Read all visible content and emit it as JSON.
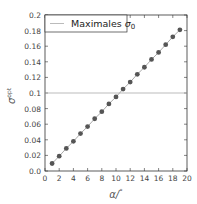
{
  "chart_data": {
    "type": "line",
    "title": "",
    "xlabel": "α/ °",
    "ylabel": "σ0^opt",
    "xlim": [
      0,
      20
    ],
    "ylim": [
      0,
      0.2
    ],
    "xticks": [
      "0",
      "2",
      "4",
      "6",
      "8",
      "10",
      "12",
      "14",
      "16",
      "18",
      "20"
    ],
    "yticks": [
      "0.0",
      "0.02",
      "0.04",
      "0.06",
      "0.08",
      "0.1",
      "0.12",
      "0.14",
      "0.16",
      "0.18",
      "0.2"
    ],
    "grid": false,
    "legend_position": "upper left",
    "series": [
      {
        "name": "σ0 opt",
        "style": "line+markers",
        "x": [
          1,
          2,
          3,
          4,
          5,
          6,
          7,
          8,
          9,
          10,
          11,
          12,
          13,
          14,
          15,
          16,
          17,
          18,
          19
        ],
        "values": [
          0.0096,
          0.019,
          0.029,
          0.038,
          0.048,
          0.057,
          0.067,
          0.076,
          0.086,
          0.095,
          0.105,
          0.114,
          0.124,
          0.133,
          0.143,
          0.152,
          0.162,
          0.172,
          0.181
        ]
      },
      {
        "name": "Maximales σ0",
        "style": "horizontal-line",
        "y": 0.1
      }
    ]
  },
  "legend": {
    "label_text": "Maximales ",
    "label_symbol": "σ",
    "label_sub": "0"
  },
  "axes": {
    "xlabel_main": "α/",
    "xlabel_unit": "°",
    "ylabel_main": "σ",
    "ylabel_sub": "0",
    "ylabel_sup": "opt"
  }
}
